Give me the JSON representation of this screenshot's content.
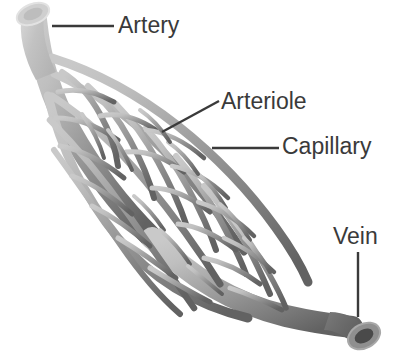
{
  "diagram": {
    "background_color": "#ffffff",
    "text_color": "#3a3a3a",
    "leader_line_color": "#3a3a3a",
    "artery_color": "#c4c4c4",
    "vein_color": "#6b6b6b",
    "mid_color": "#969696",
    "labels": {
      "artery": "Artery",
      "arteriole": "Arteriole",
      "capillary": "Capillary",
      "vein": "Vein"
    },
    "leader_lines": [
      {
        "name": "artery-leader",
        "x1": 52,
        "y1": 26,
        "x2": 114,
        "y2": 26
      },
      {
        "name": "arteriole-leader",
        "x1": 162,
        "y1": 132,
        "x2": 219,
        "y2": 101
      },
      {
        "name": "capillary-leader",
        "x1": 212,
        "y1": 148,
        "x2": 279,
        "y2": 148
      },
      {
        "name": "vein-leader",
        "x1": 358,
        "y1": 252,
        "x2": 358,
        "y2": 317
      }
    ],
    "structures": [
      {
        "name": "artery-tube",
        "label": "Artery",
        "shade": "light"
      },
      {
        "name": "arteriole-branch",
        "label": "Arteriole",
        "shade": "light-mid"
      },
      {
        "name": "capillary-mesh",
        "label": "Capillary",
        "shade": "mid"
      },
      {
        "name": "venule-branch",
        "label": "Venule",
        "shade": "mid-dark"
      },
      {
        "name": "vein-tube",
        "label": "Vein",
        "shade": "dark"
      }
    ]
  }
}
